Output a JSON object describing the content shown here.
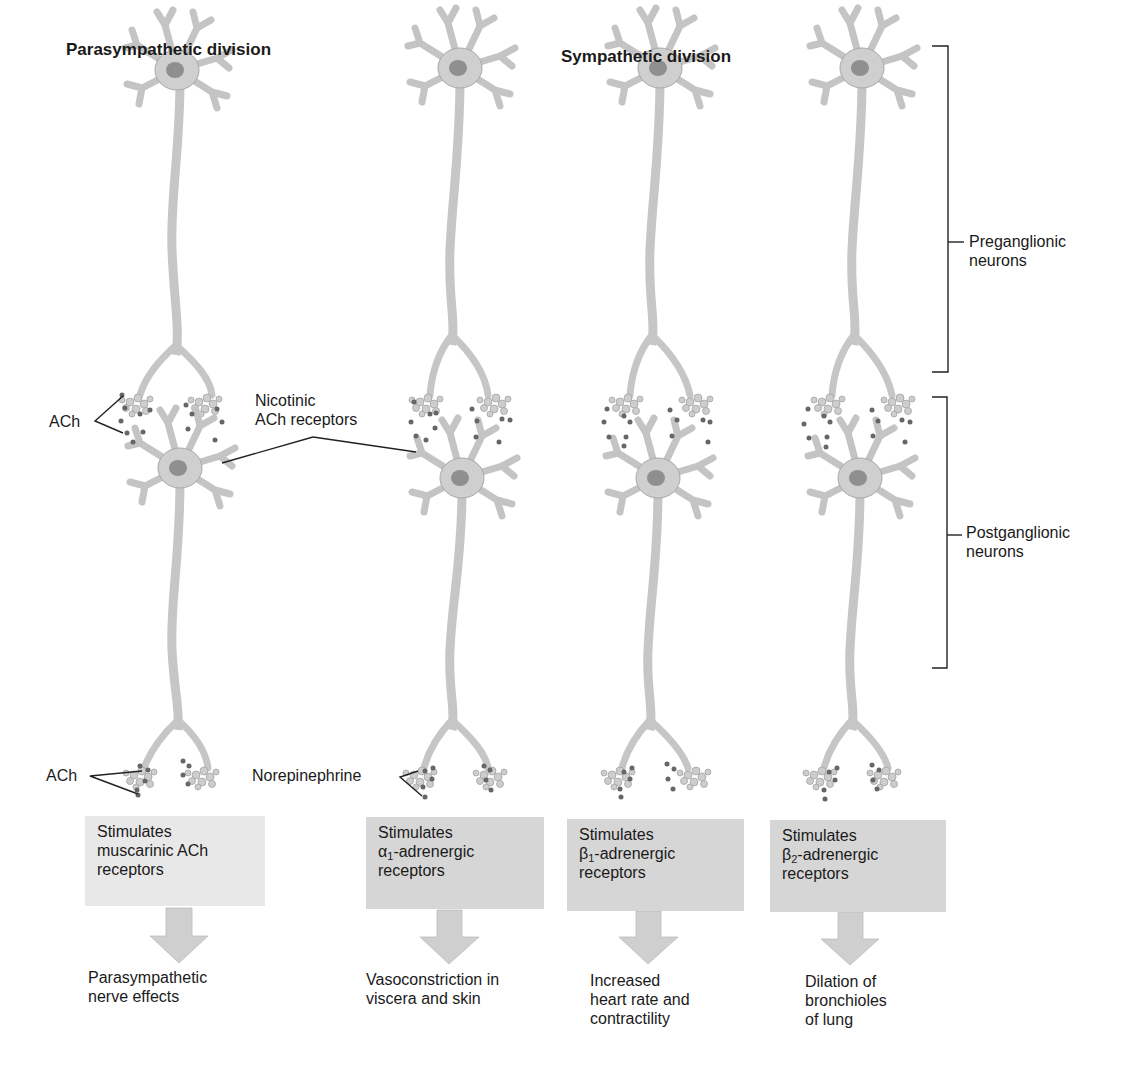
{
  "headings": {
    "parasympathetic": "Parasympathetic division",
    "sympathetic": "Sympathetic division"
  },
  "brackets": {
    "preganglionic": [
      "Preganglionic",
      "neurons"
    ],
    "postganglionic": [
      "Postganglionic",
      "neurons"
    ]
  },
  "labels": {
    "ach_ganglion": "ACh",
    "nicotinic": [
      "Nicotinic",
      "ACh receptors"
    ],
    "ach_effector": "ACh",
    "norepinephrine": "Norepinephrine"
  },
  "columns": [
    {
      "id": "parasympathetic",
      "division": "Parasympathetic",
      "box": {
        "line1": "Stimulates",
        "line2_symbol": "",
        "line2_sub": "",
        "line2": "muscarinic ACh",
        "line3": "receptors",
        "fill": "#e8e8e8"
      },
      "effect": [
        "Parasympathetic",
        "nerve effects"
      ]
    },
    {
      "id": "alpha1",
      "division": "Sympathetic",
      "box": {
        "line1": "Stimulates",
        "line2_symbol": "α",
        "line2_sub": "1",
        "line2": "-adrenergic",
        "line3": "receptors",
        "fill": "#d6d6d6"
      },
      "effect": [
        "Vasoconstriction in",
        "viscera and skin"
      ]
    },
    {
      "id": "beta1",
      "division": "Sympathetic",
      "box": {
        "line1": "Stimulates",
        "line2_symbol": "β",
        "line2_sub": "1",
        "line2": "-adrenergic",
        "line3": "receptors",
        "fill": "#d6d6d6"
      },
      "effect": [
        "Increased",
        "heart rate and",
        "contractility"
      ]
    },
    {
      "id": "beta2",
      "division": "Sympathetic",
      "box": {
        "line1": "Stimulates",
        "line2_symbol": "β",
        "line2_sub": "2",
        "line2": "-adrenergic",
        "line3": "receptors",
        "fill": "#d6d6d6"
      },
      "effect": [
        "Dilation of",
        "bronchioles",
        "of lung"
      ]
    }
  ],
  "colors": {
    "neuron_fill": "#d2d2d2",
    "neuron_stroke": "#a8a8a8",
    "nucleus": "#8a8a8a",
    "dot": "#666666",
    "line": "#222222",
    "arrow": "#cfcfcf"
  }
}
